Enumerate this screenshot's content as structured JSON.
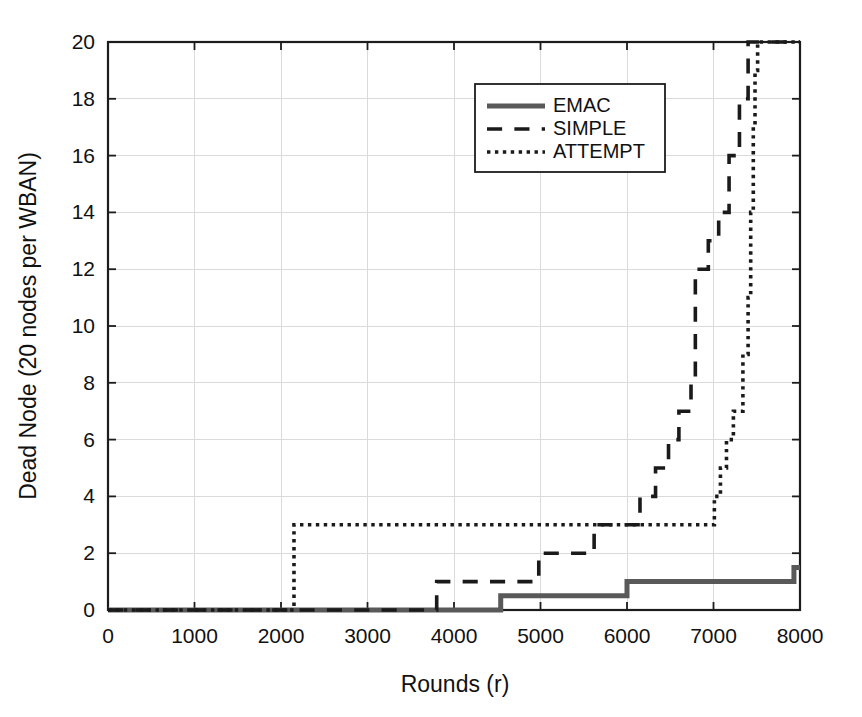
{
  "chart_data": {
    "type": "line",
    "title": "",
    "xlabel": "Rounds (r)",
    "ylabel": "Dead Node (20 nodes per WBAN)",
    "xlim": [
      0,
      8000
    ],
    "ylim": [
      0,
      20
    ],
    "xticks": [
      0,
      1000,
      2000,
      3000,
      4000,
      5000,
      6000,
      7000,
      8000
    ],
    "yticks": [
      0,
      2,
      4,
      6,
      8,
      10,
      12,
      14,
      16,
      18,
      20
    ],
    "xtick_labels": [
      "0",
      "1000",
      "2000",
      "3000",
      "4000",
      "5000",
      "6000",
      "7000",
      "8000"
    ],
    "ytick_labels": [
      "0",
      "2",
      "4",
      "6",
      "8",
      "10",
      "12",
      "14",
      "16",
      "18",
      "20"
    ],
    "grid": true,
    "legend_position": "upper center",
    "series": [
      {
        "name": "EMAC",
        "style": "solid",
        "color": "#595959",
        "width": 5,
        "points": [
          [
            0,
            0
          ],
          [
            4540,
            0
          ],
          [
            4540,
            0.5
          ],
          [
            6000,
            0.5
          ],
          [
            6000,
            1.0
          ],
          [
            7930,
            1.0
          ],
          [
            7930,
            1.5
          ],
          [
            8000,
            1.5
          ]
        ]
      },
      {
        "name": "SIMPLE",
        "style": "dashed",
        "color": "#1a1a1a",
        "width": 3.6,
        "points": [
          [
            0,
            0
          ],
          [
            3800,
            0
          ],
          [
            3800,
            1
          ],
          [
            4980,
            1
          ],
          [
            4980,
            2
          ],
          [
            5620,
            2
          ],
          [
            5620,
            3
          ],
          [
            6150,
            3
          ],
          [
            6150,
            4
          ],
          [
            6330,
            4
          ],
          [
            6330,
            5
          ],
          [
            6480,
            5
          ],
          [
            6480,
            6
          ],
          [
            6600,
            6
          ],
          [
            6600,
            7
          ],
          [
            6740,
            7
          ],
          [
            6740,
            8
          ],
          [
            6790,
            8
          ],
          [
            6790,
            12
          ],
          [
            6940,
            12
          ],
          [
            6940,
            13
          ],
          [
            7060,
            13
          ],
          [
            7060,
            14
          ],
          [
            7180,
            14
          ],
          [
            7180,
            16
          ],
          [
            7300,
            16
          ],
          [
            7300,
            18
          ],
          [
            7400,
            18
          ],
          [
            7400,
            20
          ],
          [
            8000,
            20
          ]
        ]
      },
      {
        "name": "ATTEMPT",
        "style": "dotted",
        "color": "#1a1a1a",
        "width": 3.6,
        "points": [
          [
            0,
            0
          ],
          [
            2150,
            0
          ],
          [
            2150,
            3
          ],
          [
            7010,
            3
          ],
          [
            7010,
            4
          ],
          [
            7080,
            4
          ],
          [
            7080,
            5
          ],
          [
            7150,
            5
          ],
          [
            7150,
            6
          ],
          [
            7230,
            6
          ],
          [
            7230,
            7
          ],
          [
            7340,
            7
          ],
          [
            7340,
            9
          ],
          [
            7400,
            9
          ],
          [
            7400,
            11
          ],
          [
            7430,
            11
          ],
          [
            7430,
            14
          ],
          [
            7460,
            14
          ],
          [
            7460,
            17
          ],
          [
            7480,
            17
          ],
          [
            7480,
            19
          ],
          [
            7510,
            19
          ],
          [
            7510,
            20
          ],
          [
            8000,
            20
          ]
        ]
      }
    ],
    "legend": [
      {
        "label": "EMAC",
        "style": "solid"
      },
      {
        "label": "SIMPLE",
        "style": "dashed"
      },
      {
        "label": "ATTEMPT",
        "style": "dotted"
      }
    ]
  },
  "colors": {
    "background": "#ffffff",
    "axis": "#1c1c1c",
    "grid": "#dadada",
    "emac": "#595959",
    "simple": "#1a1a1a",
    "attempt": "#1a1a1a"
  }
}
